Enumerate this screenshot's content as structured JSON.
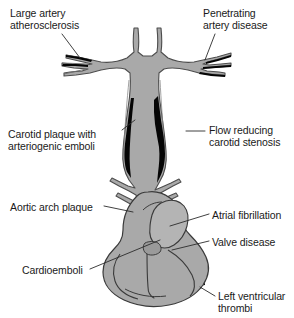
{
  "figure": {
    "background_color": "#ffffff",
    "vessel_fill": "#a9a9a9",
    "vessel_stroke": "#4d4d4d",
    "heart_fill": "#a9a9a9",
    "heart_stroke": "#3a3a3a",
    "plaque_color": "#050505",
    "leader_color": "#2b2b2b",
    "text_color": "#1a1a1a"
  },
  "labels": [
    {
      "id": "large-artery-atherosclerosis",
      "line1": "Large artery",
      "line2": "atherosclerosis",
      "x": 10,
      "y": 7,
      "side": "left"
    },
    {
      "id": "penetrating-artery-disease",
      "line1": "Penetrating",
      "line2": "artery disease",
      "x": 203,
      "y": 7,
      "side": "right"
    },
    {
      "id": "carotid-plaque-with-arteriogenic-emboli",
      "line1": "Carotid plaque with",
      "line2": "arteriogenic emboli",
      "x": 8,
      "y": 128,
      "side": "left"
    },
    {
      "id": "flow-reducing-carotid-stenosis",
      "line1": "Flow reducing",
      "line2": "carotid stenosis",
      "x": 209,
      "y": 124,
      "side": "right"
    },
    {
      "id": "aortic-arch-plaque",
      "line1": "Aortic arch plaque",
      "line2": "",
      "x": 10,
      "y": 201,
      "side": "left"
    },
    {
      "id": "atrial-fibrillation",
      "line1": "Atrial fibrillation",
      "line2": "",
      "x": 212,
      "y": 209,
      "side": "right"
    },
    {
      "id": "valve-disease",
      "line1": "Valve disease",
      "line2": "",
      "x": 212,
      "y": 236,
      "side": "right"
    },
    {
      "id": "cardioemboli",
      "line1": "Cardioemboli",
      "line2": "",
      "x": 22,
      "y": 264,
      "side": "left"
    },
    {
      "id": "left-ventricular-thrombi",
      "line1": "Left ventricular",
      "line2": "thrombi",
      "x": 218,
      "y": 290,
      "side": "right"
    }
  ]
}
